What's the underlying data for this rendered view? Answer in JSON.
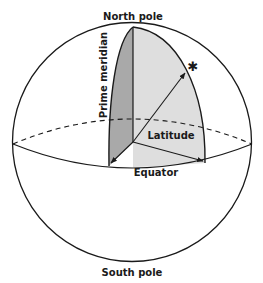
{
  "diagram": {
    "type": "sphere-coordinate-illustration",
    "labels": {
      "north_pole": "North pole",
      "south_pole": "South pole",
      "equator": "Equator",
      "prime_meridian": "Prime meridian",
      "latitude": "Latitude"
    },
    "marker": {
      "symbol": "✱",
      "meaning": "point on sphere"
    },
    "colors": {
      "stroke": "#1a1a1a",
      "prime_meridian_fill": "#a9a9a9",
      "latitude_fill": "#dedede",
      "background": "#ffffff"
    }
  }
}
